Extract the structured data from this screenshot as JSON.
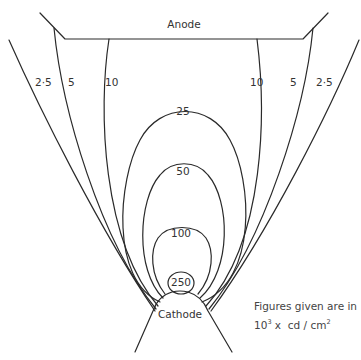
{
  "diagram": {
    "anode_label": "Anode",
    "cathode_label": "Cathode",
    "note": {
      "line1": "Figures given are in",
      "line2_base": "10",
      "line2_exp": "3",
      "line2_rest": " x  cd / cm",
      "line2_exp2": "2"
    },
    "open_contours": {
      "left": [
        "2·5",
        "5",
        "10"
      ],
      "right": [
        "10",
        "5",
        "2·5"
      ]
    },
    "closed_contours": [
      "25",
      "50",
      "100",
      "250"
    ],
    "units": "10^3 x cd/cm^2",
    "line_color": "#2a2a2a"
  }
}
